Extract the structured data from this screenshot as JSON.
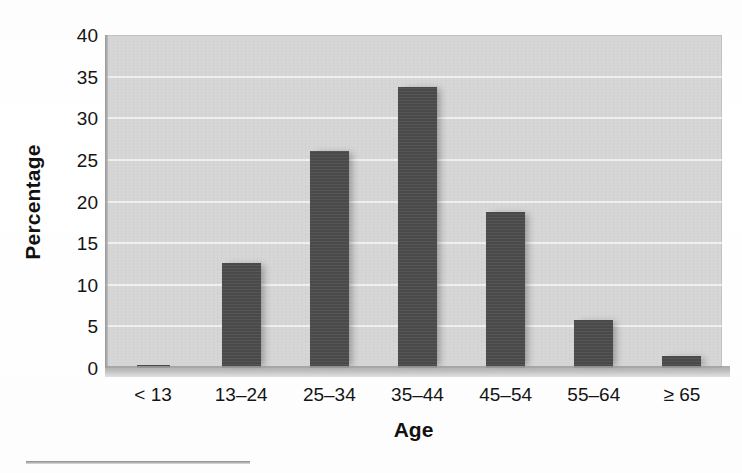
{
  "chart_data": {
    "type": "bar",
    "title": "",
    "xlabel": "Age",
    "ylabel": "Percentage",
    "categories": [
      "< 13",
      "13–24",
      "25–34",
      "35–44",
      "45–54",
      "55–64",
      "≥ 65"
    ],
    "values": [
      0.3,
      12.6,
      26.1,
      33.7,
      18.8,
      5.8,
      1.5
    ],
    "ylim": [
      0,
      40
    ],
    "yticks": [
      0,
      5,
      10,
      15,
      20,
      25,
      30,
      35,
      40
    ],
    "ytick_labels": [
      "0",
      "5",
      "10",
      "15",
      "20",
      "25",
      "30",
      "35",
      "40"
    ],
    "grid": true,
    "grid_axis": "y",
    "legend": false,
    "legend_position": "none",
    "colors": {
      "bar": "#4a4a4a",
      "plot_background": "#d5d5d5",
      "gridline": "#f2f2f2",
      "text": "#141414",
      "page_background": "#ffffff"
    }
  }
}
